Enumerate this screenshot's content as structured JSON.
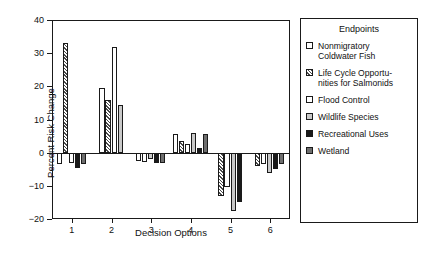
{
  "chart_data": {
    "type": "bar",
    "title": "",
    "xlabel": "Decision Options",
    "ylabel": "Percent Risk Change",
    "categories": [
      "1",
      "2",
      "3",
      "4",
      "5",
      "6"
    ],
    "ylim": [
      -20,
      40
    ],
    "yticks": [
      -20,
      -10,
      0,
      10,
      20,
      30,
      40
    ],
    "ytick_labels": [
      "−20",
      "−10",
      "0",
      "10",
      "20",
      "30",
      "40"
    ],
    "grid": false,
    "legend_position": "right",
    "legend_title": "Endpoints",
    "series": [
      {
        "name": "Nonmigratory Coldwater Fish",
        "pattern": "white",
        "values": [
          -3.5,
          19.5,
          -2.5,
          5.5,
          null,
          null
        ]
      },
      {
        "name": "Life Cycle Opportunities for Salmonids",
        "pattern": "diagonal-hatch",
        "values": [
          33.0,
          16.0,
          null,
          3.5,
          -13.0,
          -4.0
        ]
      },
      {
        "name": "Flood Control",
        "pattern": "white",
        "values": [
          -3.0,
          32.0,
          -2.8,
          2.5,
          -10.5,
          -3.5
        ]
      },
      {
        "name": "Wildlife Species",
        "pattern": "light-gray",
        "values": [
          null,
          14.5,
          -2.0,
          6.0,
          -17.5,
          -6.0
        ]
      },
      {
        "name": "Recreational Uses",
        "pattern": "black",
        "values": [
          -4.5,
          null,
          -3.0,
          1.5,
          -15.0,
          -5.0
        ]
      },
      {
        "name": "Wetland",
        "pattern": "dark-gray",
        "values": [
          -3.5,
          null,
          -3.0,
          5.5,
          null,
          -3.5
        ]
      }
    ]
  },
  "legend": {
    "title": "Endpoints",
    "items": [
      {
        "label_line1": "Nonmigratory",
        "label_line2": "Coldwater Fish",
        "pattern": "white"
      },
      {
        "label_line1": "Life Cycle Opportu-",
        "label_line2": "nities for Salmonids",
        "pattern": "diagonal-hatch"
      },
      {
        "label_line1": "Flood Control",
        "label_line2": "",
        "pattern": "white"
      },
      {
        "label_line1": "Wildlife Species",
        "label_line2": "",
        "pattern": "light-gray"
      },
      {
        "label_line1": "Recreational Uses",
        "label_line2": "",
        "pattern": "black"
      },
      {
        "label_line1": "Wetland",
        "label_line2": "",
        "pattern": "dark-gray"
      }
    ]
  },
  "colors": {
    "axis": "#1a1a1a",
    "white": "#ffffff",
    "light_gray": "#c9c9c9",
    "dark_gray": "#6e6e6e",
    "black": "#1a1a1a"
  }
}
